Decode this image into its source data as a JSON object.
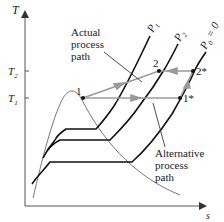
{
  "diagram": {
    "type": "T-s diagram (compression process)",
    "axes": {
      "y_label": "T",
      "x_label": "s",
      "y_ticks": [
        {
          "label": "T",
          "sub": "2",
          "y": 71
        },
        {
          "label": "T",
          "sub": "1",
          "y": 98
        }
      ]
    },
    "isobars": [
      {
        "label": "P",
        "sub": "1"
      },
      {
        "label": "P",
        "sub": "2"
      },
      {
        "label": "P",
        "sub": "0",
        "suffix": " = 0"
      }
    ],
    "points": [
      {
        "label": "1"
      },
      {
        "label": "2"
      },
      {
        "label": "2*"
      },
      {
        "label": "1*"
      }
    ],
    "annotations": {
      "actual": [
        "Actual",
        "process",
        "path"
      ],
      "alternative": [
        "Alternative",
        "process",
        "path"
      ]
    },
    "colors": {
      "curve": "#111111",
      "dome": "#777777",
      "path": "#9a9a9a",
      "axis": "#555555"
    }
  }
}
